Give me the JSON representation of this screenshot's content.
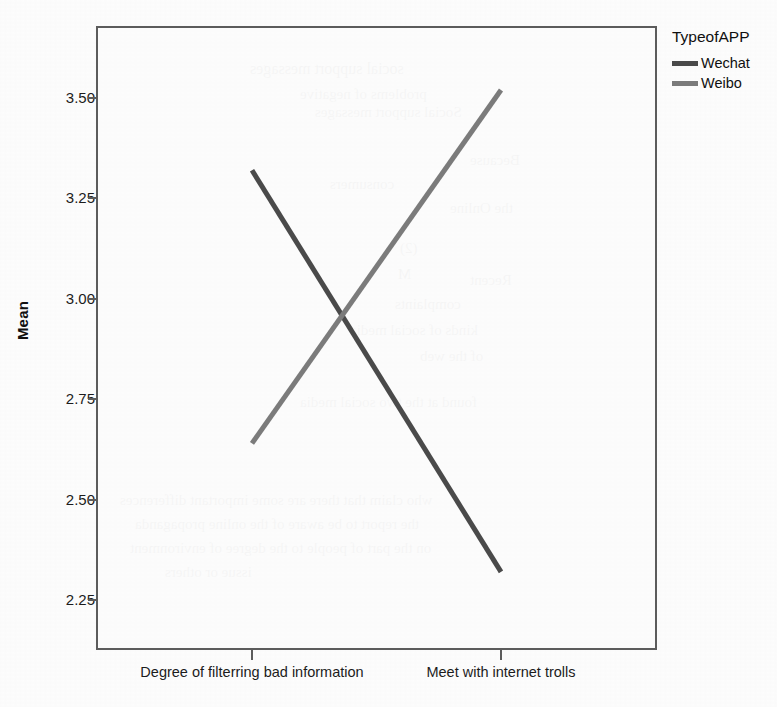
{
  "chart_data": {
    "type": "line",
    "title": "",
    "xlabel": "",
    "ylabel": "Mean",
    "categories": [
      "Degree of filterring bad information",
      "Meet with internet trolls"
    ],
    "series": [
      {
        "name": "Wechat",
        "values": [
          3.32,
          2.32
        ],
        "color": "#4a4a4a"
      },
      {
        "name": "Weibo",
        "values": [
          2.64,
          3.52
        ],
        "color": "#7b7b7b"
      }
    ],
    "yticks": [
      "3.50",
      "3.25",
      "3.00",
      "2.75",
      "2.50",
      "2.25"
    ],
    "ytick_values": [
      3.5,
      3.25,
      3.0,
      2.75,
      2.5,
      2.25
    ],
    "ylim": [
      2.1455,
      3.6604
    ],
    "grid": false,
    "legend_position": "right",
    "legend_title": "TypeofAPP",
    "crossing_point_mean": 2.96
  },
  "axes": {
    "y_title": "Mean",
    "y_ticks": [
      "3.50",
      "3.25",
      "3.00",
      "2.75",
      "2.50",
      "2.25"
    ],
    "x_ticks": [
      "Degree of filterring bad information",
      "Meet with internet trolls"
    ]
  },
  "legend": {
    "title": "TypeofAPP",
    "items": [
      {
        "label": "Wechat",
        "color": "#4a4a4a"
      },
      {
        "label": "Weibo",
        "color": "#7b7b7b"
      }
    ]
  },
  "ghost_text": [
    {
      "text": "social support messages",
      "x": 250,
      "y": 60,
      "size": 16,
      "rot": 0
    },
    {
      "text": "problems of negative",
      "x": 300,
      "y": 86,
      "size": 15,
      "rot": 0
    },
    {
      "text": "Social support messages",
      "x": 315,
      "y": 104,
      "size": 15,
      "rot": 0
    },
    {
      "text": "Because",
      "x": 470,
      "y": 152,
      "size": 15,
      "rot": 0
    },
    {
      "text": "consumers",
      "x": 330,
      "y": 176,
      "size": 15,
      "rot": 0
    },
    {
      "text": "the Online",
      "x": 450,
      "y": 200,
      "size": 15,
      "rot": 0
    },
    {
      "text": "(2)",
      "x": 400,
      "y": 240,
      "size": 15,
      "rot": 0
    },
    {
      "text": "M",
      "x": 398,
      "y": 266,
      "size": 15,
      "rot": 0
    },
    {
      "text": "Recent",
      "x": 470,
      "y": 272,
      "size": 15,
      "rot": 0
    },
    {
      "text": "complaints",
      "x": 395,
      "y": 296,
      "size": 15,
      "rot": 0
    },
    {
      "text": "kinds of social media",
      "x": 350,
      "y": 322,
      "size": 15,
      "rot": 0
    },
    {
      "text": "of the web",
      "x": 420,
      "y": 348,
      "size": 15,
      "rot": 0
    },
    {
      "text": "found at the two social media",
      "x": 300,
      "y": 394,
      "size": 15,
      "rot": 0
    },
    {
      "text": "who claim that there are some important differences",
      "x": 120,
      "y": 492,
      "size": 15,
      "rot": 0
    },
    {
      "text": "the report to be aware of the online propaganda",
      "x": 135,
      "y": 516,
      "size": 15,
      "rot": 0
    },
    {
      "text": "on the part of people to the degree of environment",
      "x": 130,
      "y": 540,
      "size": 15,
      "rot": 0
    },
    {
      "text": "issue or others",
      "x": 165,
      "y": 564,
      "size": 15,
      "rot": 0
    }
  ],
  "layout": {
    "plot_left": 96,
    "plot_top": 26,
    "plot_width": 561,
    "plot_height": 624,
    "y_top_value": 3.5,
    "y_top_px": 98,
    "y_bottom_value": 2.25,
    "y_bottom_px": 600,
    "x_positions_px": [
      252,
      501
    ]
  }
}
